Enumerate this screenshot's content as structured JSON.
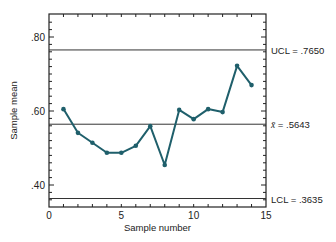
{
  "chart_data": {
    "type": "line",
    "title": "",
    "xlabel": "Sample number",
    "ylabel": "Sample mean",
    "xlim": [
      0,
      15
    ],
    "ylim": [
      0.34,
      0.86
    ],
    "x_ticks": [
      0,
      5,
      10,
      15
    ],
    "x_tick_labels": [
      "0",
      "5",
      "10",
      "15"
    ],
    "y_ticks": [
      0.4,
      0.6,
      0.8
    ],
    "y_tick_labels": [
      ".40",
      ".60",
      ".80"
    ],
    "grid": false,
    "series": [
      {
        "name": "Sample mean",
        "color": "#1f5f6b",
        "x": [
          1,
          2,
          3,
          4,
          5,
          6,
          7,
          8,
          9,
          10,
          11,
          12,
          13,
          14
        ],
        "values": [
          0.605,
          0.541,
          0.514,
          0.487,
          0.487,
          0.506,
          0.559,
          0.454,
          0.603,
          0.578,
          0.605,
          0.597,
          0.722,
          0.67
        ]
      }
    ],
    "reference_lines": [
      {
        "name": "UCL",
        "value": 0.765,
        "label": "UCL = .7650"
      },
      {
        "name": "center",
        "value": 0.5643,
        "label_symbol": "x̄",
        "label": " = .5643"
      },
      {
        "name": "LCL",
        "value": 0.3635,
        "label": "LCL = .3635"
      }
    ]
  }
}
